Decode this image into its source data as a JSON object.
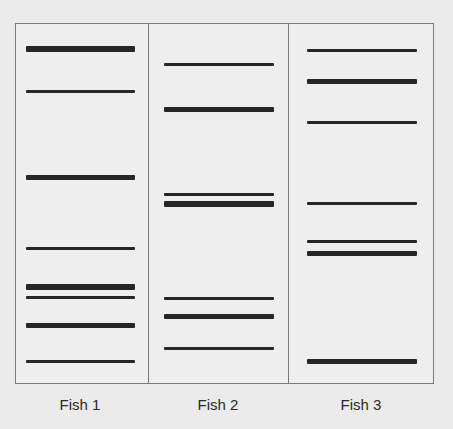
{
  "diagram": {
    "type": "gel-electrophoresis",
    "band_color": "#262626",
    "border_color": "#7a7a7a",
    "background": "#ebebeb",
    "lanes": [
      {
        "label": "Fish 1",
        "x": 26,
        "width": 109,
        "bands": [
          {
            "y": 49,
            "h": 6
          },
          {
            "y": 91,
            "h": 3
          },
          {
            "y": 177,
            "h": 5
          },
          {
            "y": 248,
            "h": 3
          },
          {
            "y": 287,
            "h": 6
          },
          {
            "y": 297,
            "h": 3
          },
          {
            "y": 325,
            "h": 5
          },
          {
            "y": 361,
            "h": 3
          }
        ]
      },
      {
        "label": "Fish 2",
        "x": 164,
        "width": 110,
        "bands": [
          {
            "y": 64,
            "h": 3
          },
          {
            "y": 109,
            "h": 5
          },
          {
            "y": 194,
            "h": 3
          },
          {
            "y": 204,
            "h": 6
          },
          {
            "y": 298,
            "h": 3
          },
          {
            "y": 316,
            "h": 5
          },
          {
            "y": 348,
            "h": 3
          }
        ]
      },
      {
        "label": "Fish 3",
        "x": 307,
        "width": 110,
        "bands": [
          {
            "y": 50,
            "h": 3
          },
          {
            "y": 81,
            "h": 5
          },
          {
            "y": 122,
            "h": 3
          },
          {
            "y": 203,
            "h": 3
          },
          {
            "y": 241,
            "h": 3
          },
          {
            "y": 253,
            "h": 5
          },
          {
            "y": 361,
            "h": 5
          }
        ]
      }
    ]
  }
}
